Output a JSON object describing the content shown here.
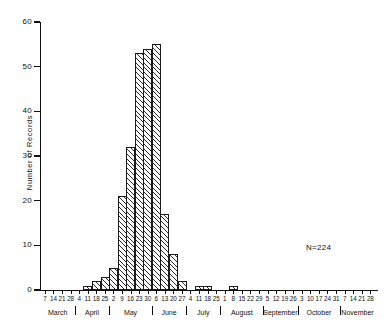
{
  "chart_data": {
    "type": "bar",
    "title": "",
    "subtitle": "",
    "xlabel": "",
    "ylabel": "Number of Records",
    "ylim": [
      0,
      60
    ],
    "yticks": [
      0,
      10,
      20,
      30,
      40,
      50,
      60
    ],
    "ytick_labels": [
      "0",
      "10",
      "20",
      "30",
      "40",
      "50",
      "60"
    ],
    "grid": false,
    "legend": null,
    "annotations": [
      {
        "text": "N=224",
        "x": 0.82,
        "y": 0.18
      }
    ],
    "month_labels": [
      "March",
      "April",
      "May",
      "June",
      "July",
      "August",
      "September",
      "October",
      "November"
    ],
    "categories": [
      "7",
      "14",
      "21",
      "28",
      "4",
      "11",
      "18",
      "25",
      "2",
      "9",
      "16",
      "23",
      "30",
      "6",
      "13",
      "20",
      "27",
      "4",
      "11",
      "18",
      "25",
      "1",
      "8",
      "15",
      "22",
      "29",
      "5",
      "12",
      "19",
      "26",
      "3",
      "10",
      "17",
      "24",
      "31",
      "7",
      "14",
      "21",
      "28"
    ],
    "values": [
      0,
      0,
      0,
      0,
      0,
      1,
      2,
      3,
      5,
      21,
      32,
      53,
      54,
      55,
      17,
      8,
      2,
      0,
      1,
      1,
      0,
      0,
      1,
      0,
      0,
      0,
      0,
      0,
      0,
      0,
      0,
      0,
      0,
      0,
      0,
      0,
      0,
      0,
      0
    ]
  },
  "annotation": {
    "n_label": "N=224"
  },
  "axis": {
    "y_title": "Number of Records"
  }
}
